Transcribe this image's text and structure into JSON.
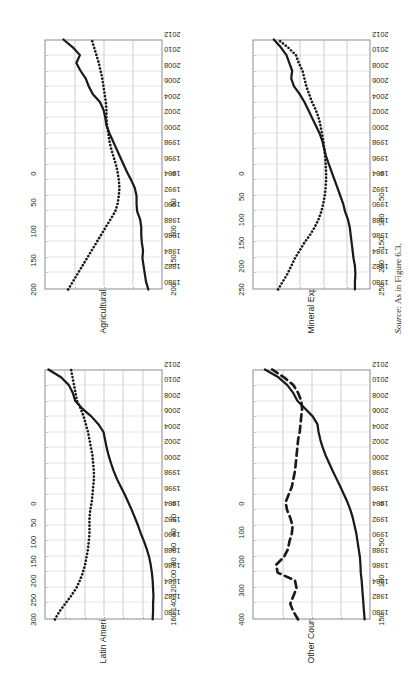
{
  "figure": {
    "source_label": "Source:",
    "source_text": "As in Figure 6.3.",
    "orientation": "rotated-90-ccw"
  },
  "chart_data": [
    {
      "id": "latin-america",
      "type": "line",
      "title": "Latin America mean (18 countries)",
      "xlabel": "",
      "ylabel": "",
      "grid": true,
      "legend_position": "none",
      "x": [
        1980,
        1981,
        1982,
        1983,
        1984,
        1985,
        1986,
        1987,
        1988,
        1989,
        1990,
        1991,
        1992,
        1993,
        1994,
        1995,
        1996,
        1997,
        1998,
        1999,
        2000,
        2001,
        2002,
        2003,
        2004,
        2005,
        2006,
        2007,
        2008,
        2009,
        2010,
        2011,
        2012
      ],
      "xticks": [
        1980,
        1982,
        1984,
        1986,
        1988,
        1990,
        1992,
        1994,
        1996,
        1998,
        2000,
        2002,
        2004,
        2006,
        2008,
        2010,
        2012
      ],
      "axis_left": {
        "ticks": [
          0,
          50,
          100,
          150,
          200,
          250,
          300
        ],
        "ylim": [
          0,
          300
        ]
      },
      "axis_right": {
        "ticks": [
          0,
          20,
          40,
          60,
          80,
          100,
          120,
          140,
          160
        ],
        "ylim": [
          0,
          160
        ]
      },
      "series": [
        {
          "name": "solid",
          "style": "solid",
          "axis": "left",
          "values": [
            25,
            24,
            24,
            23,
            24,
            25,
            27,
            30,
            34,
            40,
            47,
            55,
            62,
            70,
            78,
            87,
            96,
            106,
            116,
            124,
            131,
            137,
            142,
            146,
            150,
            163,
            181,
            204,
            222,
            228,
            238,
            258,
            290
          ]
        },
        {
          "name": "dotted",
          "style": "dotted",
          "axis": "right",
          "values": [
            146,
            140,
            132,
            124,
            117,
            112,
            108,
            105,
            103,
            101,
            100,
            99,
            99,
            99,
            98,
            96,
            95,
            94,
            93,
            93,
            94,
            95,
            97,
            99,
            101,
            104,
            107,
            111,
            116,
            118,
            120,
            122,
            124
          ]
        }
      ]
    },
    {
      "id": "agricultural-exporters",
      "type": "line",
      "title": "Agricultural Exporters (3 countries)",
      "xlabel": "",
      "ylabel": "",
      "grid": true,
      "legend_position": "none",
      "x": [
        1980,
        1981,
        1982,
        1983,
        1984,
        1985,
        1986,
        1987,
        1988,
        1989,
        1990,
        1991,
        1992,
        1993,
        1994,
        1995,
        1996,
        1997,
        1998,
        1999,
        2000,
        2001,
        2002,
        2003,
        2004,
        2005,
        2006,
        2007,
        2008,
        2009,
        2010,
        2011,
        2012
      ],
      "xticks": [
        1980,
        1982,
        1984,
        1986,
        1988,
        1990,
        1992,
        1994,
        1996,
        1998,
        2000,
        2002,
        2004,
        2006,
        2008,
        2010,
        2012
      ],
      "axis_left": {
        "ticks": [
          0,
          50,
          100,
          150,
          200
        ],
        "ylim": [
          0,
          200
        ]
      },
      "axis_right": {
        "ticks": [
          0,
          50,
          100,
          150,
          200
        ],
        "ylim": [
          0,
          200
        ]
      },
      "series": [
        {
          "name": "solid",
          "style": "solid",
          "axis": "left",
          "values": [
            24,
            28,
            30,
            32,
            34,
            33,
            35,
            36,
            36,
            38,
            43,
            44,
            44,
            47,
            53,
            60,
            66,
            72,
            78,
            84,
            90,
            95,
            97,
            100,
            106,
            118,
            125,
            130,
            139,
            146,
            140,
            152,
            168
          ]
        },
        {
          "name": "dotted",
          "style": "dotted",
          "axis": "right",
          "values": [
            160,
            152,
            144,
            136,
            128,
            120,
            112,
            104,
            96,
            88,
            80,
            76,
            74,
            73,
            74,
            76,
            79,
            83,
            87,
            90,
            92,
            94,
            95,
            95,
            96,
            98,
            100,
            102,
            105,
            108,
            112,
            116,
            120
          ]
        }
      ]
    },
    {
      "id": "other-countries",
      "type": "line",
      "title": "Other Countries (9 countries)",
      "xlabel": "",
      "ylabel": "",
      "grid": true,
      "legend_position": "none",
      "x": [
        1980,
        1981,
        1982,
        1983,
        1984,
        1985,
        1986,
        1987,
        1988,
        1989,
        1990,
        1991,
        1992,
        1993,
        1994,
        1995,
        1996,
        1997,
        1998,
        1999,
        2000,
        2001,
        2002,
        2003,
        2004,
        2005,
        2006,
        2007,
        2008,
        2009,
        2010,
        2011,
        2012
      ],
      "xticks": [
        1980,
        1982,
        1984,
        1986,
        1988,
        1990,
        1992,
        1994,
        1996,
        1998,
        2000,
        2002,
        2004,
        2006,
        2008,
        2010,
        2012
      ],
      "axis_left": {
        "ticks": [
          0,
          100,
          200,
          300,
          400
        ],
        "ylim": [
          0,
          400
        ]
      },
      "axis_right": {
        "ticks": [
          0,
          50,
          100,
          150
        ],
        "ylim": [
          0,
          150
        ]
      },
      "series": [
        {
          "name": "solid",
          "style": "solid",
          "axis": "left",
          "values": [
            20,
            22,
            24,
            26,
            28,
            30,
            33,
            34,
            36,
            40,
            44,
            48,
            54,
            60,
            68,
            78,
            90,
            102,
            115,
            128,
            140,
            152,
            162,
            170,
            176,
            180,
            196,
            222,
            248,
            262,
            282,
            312,
            358
          ]
        },
        {
          "name": "dashed",
          "style": "dashed",
          "axis": "right",
          "values": [
            92,
            98,
            102,
            98,
            94,
            96,
            118,
            120,
            110,
            105,
            103,
            100,
            99,
            102,
            106,
            108,
            104,
            100,
            98,
            96,
            95,
            94,
            93,
            92,
            90,
            89,
            88,
            87,
            88,
            92,
            98,
            110,
            125
          ]
        }
      ]
    },
    {
      "id": "mineral-exporters",
      "type": "line",
      "title": "Mineral Exporters (6 countries)",
      "xlabel": "",
      "ylabel": "",
      "grid": true,
      "legend_position": "none",
      "x": [
        1980,
        1981,
        1982,
        1983,
        1984,
        1985,
        1986,
        1987,
        1988,
        1989,
        1990,
        1991,
        1992,
        1993,
        1994,
        1995,
        1996,
        1997,
        1998,
        1999,
        2000,
        2001,
        2002,
        2003,
        2004,
        2005,
        2006,
        2007,
        2008,
        2009,
        2010,
        2011,
        2012
      ],
      "xticks": [
        1980,
        1982,
        1984,
        1986,
        1988,
        1990,
        1992,
        1994,
        1996,
        1998,
        2000,
        2002,
        2004,
        2006,
        2008,
        2010,
        2012
      ],
      "axis_left": {
        "ticks": [
          0,
          50,
          100,
          150,
          200,
          250
        ],
        "ylim": [
          0,
          250
        ]
      },
      "axis_right": {
        "ticks": [
          0,
          50,
          100,
          150,
          200,
          250
        ],
        "ylim": [
          0,
          250
        ]
      },
      "series": [
        {
          "name": "solid",
          "style": "solid",
          "axis": "left",
          "values": [
            33,
            33,
            32,
            33,
            36,
            38,
            40,
            42,
            44,
            48,
            54,
            58,
            64,
            70,
            76,
            82,
            88,
            94,
            98,
            102,
            108,
            116,
            124,
            132,
            140,
            150,
            162,
            168,
            166,
            172,
            178,
            190,
            205
          ]
        },
        {
          "name": "dotted",
          "style": "dotted",
          "axis": "right",
          "values": [
            196,
            186,
            176,
            168,
            160,
            150,
            140,
            128,
            118,
            110,
            104,
            100,
            97,
            95,
            94,
            94,
            95,
            96,
            98,
            100,
            103,
            106,
            110,
            116,
            124,
            130,
            136,
            140,
            144,
            152,
            158,
            175,
            196
          ]
        }
      ]
    }
  ]
}
